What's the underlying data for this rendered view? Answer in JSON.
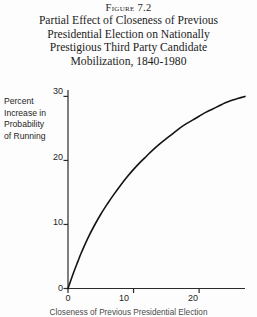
{
  "figure": {
    "number_label": "Figure 7.2",
    "title_lines": [
      "Partial Effect of Closeness of Previous",
      "Presidential Election on Nationally",
      "Prestigious Third Party Candidate",
      "Mobilization, 1840-1980"
    ]
  },
  "axes": {
    "y_label_lines": [
      "Percent",
      "Increase in",
      "Probability",
      "of Running"
    ],
    "x_label": "Closeness of Previous Presidential Election",
    "y_ticks": [
      "0",
      "10",
      "20",
      "30"
    ],
    "x_ticks": [
      "0",
      "10",
      "20"
    ]
  },
  "colors": {
    "background": "#fdfdfd",
    "axis": "#2b2b2b",
    "curve": "#141414",
    "text": "#1c1c1c"
  },
  "chart_data": {
    "type": "line",
    "title": "Partial Effect of Closeness of Previous Presidential Election on Nationally Prestigious Third Party Candidate Mobilization, 1840-1980",
    "xlabel": "Closeness of Previous Presidential Election",
    "ylabel": "Percent Increase in Probability of Running",
    "xlim": [
      0,
      27
    ],
    "ylim": [
      0,
      31
    ],
    "xticks": [
      0,
      10,
      20
    ],
    "yticks": [
      0,
      10,
      20,
      30
    ],
    "grid": false,
    "legend": false,
    "series": [
      {
        "name": "Partial effect",
        "x": [
          0,
          0.5,
          1,
          1.5,
          2,
          3,
          4,
          5,
          6,
          7,
          8,
          9,
          10,
          11,
          12,
          13,
          14,
          15,
          16,
          17,
          18,
          19,
          20,
          21,
          22,
          23,
          24,
          25,
          26,
          27
        ],
        "values": [
          0,
          1.5,
          2.9,
          4.2,
          5.5,
          7.8,
          9.8,
          11.6,
          13.2,
          14.7,
          16.1,
          17.4,
          18.6,
          19.7,
          20.7,
          21.7,
          22.6,
          23.4,
          24.2,
          25.0,
          25.7,
          26.3,
          26.9,
          27.5,
          28.0,
          28.5,
          29.0,
          29.4,
          29.7,
          30.0
        ]
      }
    ]
  }
}
